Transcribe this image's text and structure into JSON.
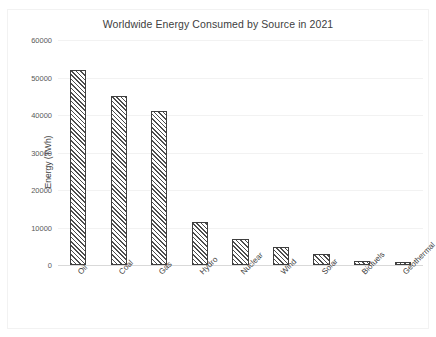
{
  "chart_data": {
    "type": "bar",
    "title": "Worldwide Energy Consumed by Source in 2021",
    "xlabel": "",
    "ylabel": "Energy (TWh)",
    "ylim": [
      0,
      60000
    ],
    "ytick_step": 10000,
    "yticks": [
      0,
      10000,
      20000,
      30000,
      40000,
      50000,
      60000
    ],
    "ytick_labels": [
      "0",
      "10000",
      "20000",
      "30000",
      "40000",
      "50000",
      "60000"
    ],
    "grid": true,
    "grid_axis": "y",
    "legend": false,
    "legend_position": "none",
    "bar_fill": "diagonal-hatch",
    "bar_edge_color": "#3f3f3f",
    "categories": [
      "Oil",
      "Coal",
      "Gas",
      "Hydro",
      "Nuclear",
      "Wind",
      "Solar",
      "Biofuels",
      "Geothermal"
    ],
    "values": [
      52000,
      45000,
      41000,
      11500,
      7000,
      4800,
      3000,
      1100,
      700
    ]
  },
  "colors": {
    "background": "#ffffff",
    "frame_border": "#f2f2f2",
    "gridline": "#f2f2f2",
    "baseline": "#d9d9d9",
    "title_text": "#404040",
    "tick_text": "#595959"
  }
}
